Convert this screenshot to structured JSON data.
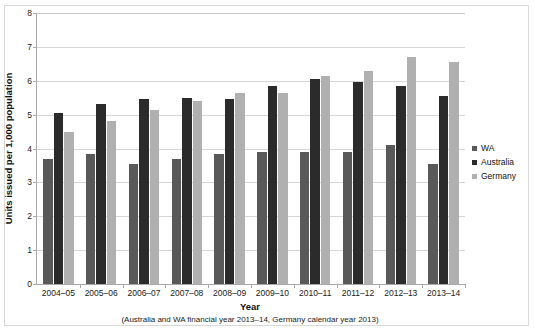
{
  "chart_data": {
    "type": "bar",
    "title": "",
    "xlabel": "Year",
    "xnote": "(Australia and WA financial year 2013–14, Germany calendar year 2013)",
    "ylabel": "Units issued per 1,000 population",
    "ylim": [
      0,
      8
    ],
    "ytick_step": 1,
    "yticks": [
      "0",
      "1",
      "2",
      "3",
      "4",
      "5",
      "6",
      "7",
      "8"
    ],
    "grid": true,
    "legend_position": "right",
    "categories": [
      "2004–05",
      "2005–06",
      "2006–07",
      "2007–08",
      "2008–09",
      "2009–10",
      "2010–11",
      "2011–12",
      "2012–13",
      "2013–14"
    ],
    "series": [
      {
        "name": "WA",
        "color": "#595959",
        "values": [
          3.7,
          3.85,
          3.55,
          3.7,
          3.85,
          3.9,
          3.9,
          3.9,
          4.1,
          3.55
        ]
      },
      {
        "name": "Australia",
        "color": "#2b2b2b",
        "values": [
          5.05,
          5.3,
          5.45,
          5.5,
          5.45,
          5.85,
          6.05,
          5.95,
          5.85,
          5.55
        ]
      },
      {
        "name": "Germany",
        "color": "#b0b0b0",
        "values": [
          4.5,
          4.8,
          5.15,
          5.4,
          5.65,
          5.65,
          6.15,
          6.3,
          6.7,
          6.55
        ]
      }
    ]
  },
  "legend": {
    "items": [
      {
        "label": "WA",
        "color": "#595959"
      },
      {
        "label": "Australia",
        "color": "#2b2b2b"
      },
      {
        "label": "Germany",
        "color": "#b0b0b0"
      }
    ]
  }
}
